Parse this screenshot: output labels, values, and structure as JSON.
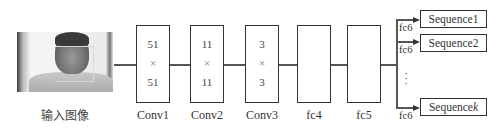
{
  "input": {
    "caption": "输入图像",
    "icon": "face-photo"
  },
  "layers": [
    {
      "name": "Conv1",
      "top": "51",
      "op": "×",
      "bottom": "51"
    },
    {
      "name": "Conv2",
      "top": "11",
      "op": "×",
      "bottom": "11"
    },
    {
      "name": "Conv3",
      "top": "3",
      "op": "×",
      "bottom": "3"
    },
    {
      "name": "fc4"
    },
    {
      "name": "fc5"
    }
  ],
  "branches": [
    {
      "layer": "fc6",
      "output": "Sequence1"
    },
    {
      "layer": "fc6",
      "output": "Sequence2"
    },
    {
      "layer": "fc6",
      "output": "Sequencek",
      "output_base": "Sequence",
      "output_italic": "k"
    }
  ],
  "ellipsis": "⋮"
}
